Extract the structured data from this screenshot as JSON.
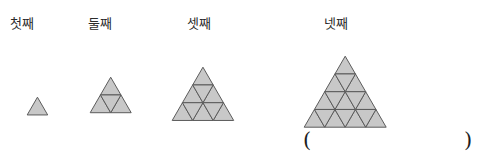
{
  "page": {
    "width": 488,
    "height": 163,
    "background": "#ffffff"
  },
  "style": {
    "triangle_fill": "#c8c8c8",
    "triangle_stroke": "#5a5a5a",
    "text_color": "#2b2b2b"
  },
  "figures": [
    {
      "label": "첫째",
      "rows": 1,
      "small_triangle_count": 1,
      "upward_count": 1,
      "downward_count": 0,
      "side_units": 1
    },
    {
      "label": "둘째",
      "rows": 2,
      "small_triangle_count": 4,
      "upward_count": 3,
      "downward_count": 1,
      "side_units": 2
    },
    {
      "label": "셋째",
      "rows": 3,
      "small_triangle_count": 9,
      "upward_count": 6,
      "downward_count": 3,
      "side_units": 3
    },
    {
      "label": "넷째",
      "rows": 4,
      "small_triangle_count": 16,
      "upward_count": 10,
      "downward_count": 6,
      "side_units": 4
    }
  ],
  "answer_field": {
    "open_paren": "(",
    "close_paren": ")",
    "value": ""
  }
}
